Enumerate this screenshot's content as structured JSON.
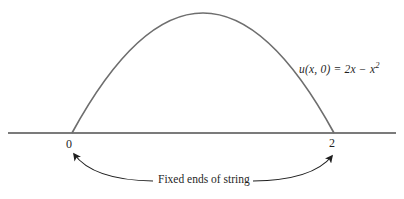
{
  "diagram": {
    "equation_text": "u(x, 0) = 2x − x",
    "equation_sup": "2",
    "left_end_label": "0",
    "right_end_label": "2",
    "caption": "Fixed ends of string",
    "fixed_end_positions": [
      "0",
      "2"
    ]
  },
  "colors": {
    "curve": "#6e6e6e",
    "axis": "#4f4f4f",
    "annotation": "#1f1f1f"
  }
}
